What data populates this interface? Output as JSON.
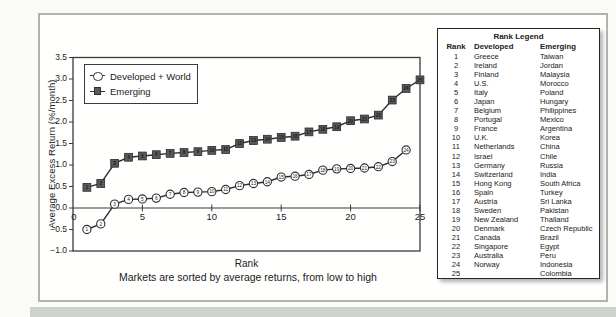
{
  "colors": {
    "line": "#2e2e2e",
    "square_fill": "#5a5a5a",
    "circle_fill": "#ffffff",
    "axis": "#3a3a3a",
    "panel_border": "#b2b2ae",
    "bottom_strip": "#ccd3cd",
    "text": "#1a1a1a"
  },
  "chart_data": {
    "type": "line",
    "title": "",
    "xlabel": "Rank",
    "ylabel": "Average Excess Return (%/month)",
    "note": "Markets are sorted by average returns, from low to high",
    "xlim": [
      0,
      25
    ],
    "ylim": [
      -1.0,
      3.5
    ],
    "xticks": [
      0,
      5,
      10,
      15,
      20,
      25
    ],
    "yticks": [
      -1.0,
      -0.5,
      0.0,
      0.5,
      1.0,
      1.5,
      2.0,
      2.5,
      3.0,
      3.5
    ],
    "legend_position": "top-left",
    "grid": false,
    "series": [
      {
        "name": "Developed + World",
        "marker": "circle",
        "x": [
          1,
          2,
          3,
          4,
          5,
          6,
          7,
          8,
          9,
          10,
          11,
          12,
          13,
          14,
          15,
          16,
          17,
          18,
          19,
          20,
          21,
          22,
          23,
          24
        ],
        "values": [
          -0.5,
          -0.37,
          0.09,
          0.2,
          0.21,
          0.23,
          0.32,
          0.36,
          0.37,
          0.38,
          0.43,
          0.52,
          0.57,
          0.61,
          0.72,
          0.74,
          0.78,
          0.88,
          0.91,
          0.92,
          0.93,
          0.96,
          1.08,
          1.35
        ]
      },
      {
        "name": "Emerging",
        "marker": "square",
        "x": [
          1,
          2,
          3,
          4,
          5,
          6,
          7,
          8,
          9,
          10,
          11,
          12,
          13,
          14,
          15,
          16,
          17,
          18,
          19,
          20,
          21,
          22,
          23,
          24,
          25
        ],
        "values": [
          0.48,
          0.57,
          1.04,
          1.18,
          1.21,
          1.24,
          1.27,
          1.29,
          1.31,
          1.34,
          1.36,
          1.5,
          1.57,
          1.6,
          1.64,
          1.67,
          1.77,
          1.83,
          1.89,
          2.03,
          2.07,
          2.16,
          2.51,
          2.78,
          2.98
        ]
      }
    ]
  },
  "rank_legend": {
    "title": "Rank Legend",
    "columns": [
      "Rank",
      "Developed",
      "Emerging"
    ],
    "rows": [
      [
        "1",
        "Greece",
        "Taiwan"
      ],
      [
        "2",
        "Ireland",
        "Jordan"
      ],
      [
        "3",
        "Finland",
        "Malaysia"
      ],
      [
        "4",
        "U.S.",
        "Morocco"
      ],
      [
        "5",
        "Italy",
        "Poland"
      ],
      [
        "6",
        "Japan",
        "Hungary"
      ],
      [
        "7",
        "Belgium",
        "Philippines"
      ],
      [
        "8",
        "Portugal",
        "Mexico"
      ],
      [
        "9",
        "France",
        "Argentina"
      ],
      [
        "10",
        "U.K.",
        "Korea"
      ],
      [
        "11",
        "Netherlands",
        "China"
      ],
      [
        "12",
        "Israel",
        "Chile"
      ],
      [
        "13",
        "Germany",
        "Russia"
      ],
      [
        "14",
        "Switzerland",
        "India"
      ],
      [
        "15",
        "Hong Kong",
        "South Africa"
      ],
      [
        "16",
        "Spain",
        "Turkey"
      ],
      [
        "17",
        "Austria",
        "Sri Lanka"
      ],
      [
        "18",
        "Sweden",
        "Pakistan"
      ],
      [
        "19",
        "New Zealand",
        "Thailand"
      ],
      [
        "20",
        "Denmark",
        "Czech Republic"
      ],
      [
        "21",
        "Canada",
        "Brazil"
      ],
      [
        "22",
        "Singapore",
        "Egypt"
      ],
      [
        "23",
        "Australia",
        "Peru"
      ],
      [
        "24",
        "Norway",
        "Indonesia"
      ],
      [
        "25",
        "",
        "Colombia"
      ]
    ]
  }
}
